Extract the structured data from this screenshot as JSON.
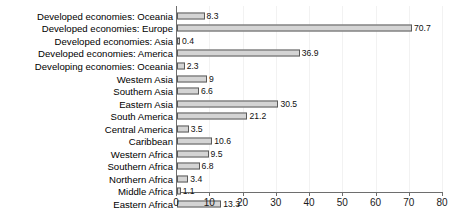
{
  "chart_data": {
    "type": "bar",
    "orientation": "horizontal",
    "title": "",
    "subtitle": "",
    "xlabel": "",
    "ylabel": "",
    "xlim": [
      0,
      80
    ],
    "xticks": [
      0,
      10,
      20,
      30,
      40,
      50,
      60,
      70,
      80
    ],
    "grid": true,
    "grid_axis": "x",
    "legend": false,
    "bar_fill_color": "#d4d4d4",
    "bar_border_color": "#5a5a5a",
    "axis_color": "#6e6e6e",
    "gridline_color": "#f2f2f2",
    "background_color": "#ffffff",
    "data_labels": true,
    "categories": [
      "Developed economies: Oceania",
      "Developed economies: Europe",
      "Developed economies: Asia",
      "Developed economies: America",
      "Developing economies: Oceania",
      "Western Asia",
      "Southern Asia",
      "Eastern Asia",
      "South America",
      "Central America",
      "Caribbean",
      "Western Africa",
      "Southern Africa",
      "Northern Africa",
      "Middle Africa",
      "Eastern Africa"
    ],
    "values": [
      8.3,
      70.7,
      0.4,
      36.9,
      2.3,
      9,
      6.6,
      30.5,
      21.2,
      3.5,
      10.6,
      9.5,
      6.8,
      3.4,
      1.1,
      13.3
    ],
    "value_labels": [
      "8.3",
      "70.7",
      "0.4",
      "36.9",
      "2.3",
      "9",
      "6.6",
      "30.5",
      "21.2",
      "3.5",
      "10.6",
      "9.5",
      "6.8",
      "3.4",
      "1.1",
      "13.3"
    ],
    "tick_labels": [
      "0",
      "10",
      "20",
      "30",
      "40",
      "50",
      "60",
      "70",
      "80"
    ]
  }
}
